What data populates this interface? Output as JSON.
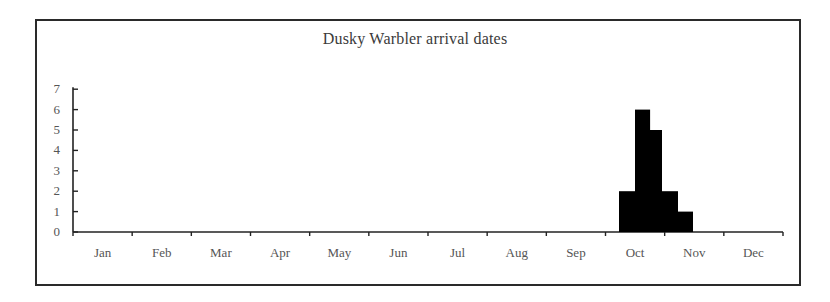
{
  "chart_data": {
    "type": "bar",
    "title": "Dusky Warbler arrival dates",
    "xlabel": "",
    "ylabel": "",
    "ylim": [
      0,
      7
    ],
    "yticks": [
      0,
      1,
      2,
      3,
      4,
      5,
      6,
      7
    ],
    "categories_months": [
      "Jan",
      "Feb",
      "Mar",
      "Apr",
      "May",
      "Jun",
      "Jul",
      "Aug",
      "Sep",
      "Oct",
      "Nov",
      "Dec"
    ],
    "bin_description": "approximately weekly bins spanning mid-October to early November",
    "bars": [
      {
        "period": "Oct week 2",
        "month": "Oct",
        "start_fraction_of_year": 0.769,
        "end_fraction_of_year": 0.7915,
        "value": 2
      },
      {
        "period": "Oct week 3",
        "month": "Oct",
        "start_fraction_of_year": 0.7915,
        "end_fraction_of_year": 0.8127,
        "value": 6
      },
      {
        "period": "Oct week 4",
        "month": "Oct",
        "start_fraction_of_year": 0.8127,
        "end_fraction_of_year": 0.8296,
        "value": 5
      },
      {
        "period": "Oct/Nov week 5",
        "month": "Nov",
        "start_fraction_of_year": 0.8296,
        "end_fraction_of_year": 0.8521,
        "value": 2
      },
      {
        "period": "Nov week 1",
        "month": "Nov",
        "start_fraction_of_year": 0.8521,
        "end_fraction_of_year": 0.8732,
        "value": 1
      }
    ],
    "values": [
      2,
      6,
      5,
      2,
      1
    ],
    "grid": false,
    "legend": null,
    "bar_color": "#000000"
  },
  "header": {
    "title": "Dusky Warbler arrival dates"
  },
  "axis": {
    "y_labels": [
      "0",
      "1",
      "2",
      "3",
      "4",
      "5",
      "6",
      "7"
    ],
    "x_labels": [
      "Jan",
      "Feb",
      "Mar",
      "Apr",
      "May",
      "Jun",
      "Jul",
      "Aug",
      "Sep",
      "Oct",
      "Nov",
      "Dec"
    ]
  },
  "colors": {
    "frame": "#2a2a2a",
    "axis": "#222222",
    "bars": "#000000",
    "text": "#555555",
    "title": "#3a3a3a"
  }
}
